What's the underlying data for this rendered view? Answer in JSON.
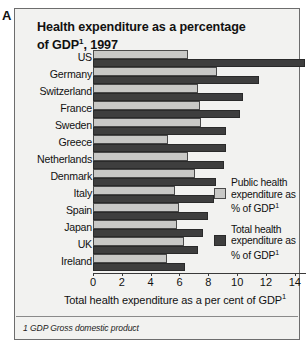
{
  "figure": {
    "panel_letter": "A",
    "title_line1": "Health expenditure as a percentage",
    "title_line2_pre": "of GDP",
    "title_sup": "1",
    "title_line2_post": ", 1997",
    "footnote": "1 GDP Gross domestic product"
  },
  "legend": {
    "items": [
      {
        "swatch": "public",
        "line1": "Public health",
        "line2": "expenditure as",
        "line3_pre": "% of GDP",
        "line3_sup": "1"
      },
      {
        "swatch": "total",
        "line1": "Total health",
        "line2": "expenditure as",
        "line3_pre": "% of GDP",
        "line3_sup": "1"
      }
    ]
  },
  "axis": {
    "xlabel_pre": "Total health expenditure as a per cent of GDP",
    "xlabel_sup": "1",
    "ticks": [
      "0",
      "2",
      "4",
      "6",
      "8",
      "10",
      "12",
      "14"
    ],
    "tick_values": [
      0,
      2,
      4,
      6,
      8,
      10,
      12,
      14
    ],
    "xmin": 0,
    "xmax": 15.4
  },
  "colors": {
    "public": "#c8c8c6",
    "total": "#3e3e3e",
    "panel_bg": "#f2f2f0",
    "border": "#6d6d6d",
    "text": "#111111"
  },
  "chart_data": {
    "type": "bar",
    "orientation": "horizontal",
    "title": "Health expenditure as a percentage of GDP1, 1997",
    "xlabel": "Total health expenditure as a per cent of GDP1",
    "ylabel": "",
    "xlim": [
      0,
      15.4
    ],
    "grid": false,
    "legend_position": "inside-right",
    "categories": [
      "US",
      "Germany",
      "Switzerland",
      "France",
      "Sweden",
      "Greece",
      "Netherlands",
      "Denmark",
      "Italy",
      "Spain",
      "Japan",
      "UK",
      "Ireland"
    ],
    "series": [
      {
        "name": "Public health expenditure as % of GDP1",
        "values": [
          6.6,
          8.6,
          7.3,
          7.4,
          7.5,
          5.2,
          6.6,
          7.1,
          5.7,
          6.0,
          5.8,
          6.3,
          5.1
        ]
      },
      {
        "name": "Total health expenditure as % of GDP1",
        "values": [
          14.7,
          11.5,
          10.4,
          10.2,
          9.2,
          9.2,
          9.1,
          8.5,
          8.4,
          8.0,
          7.6,
          7.3,
          6.4
        ]
      }
    ]
  }
}
